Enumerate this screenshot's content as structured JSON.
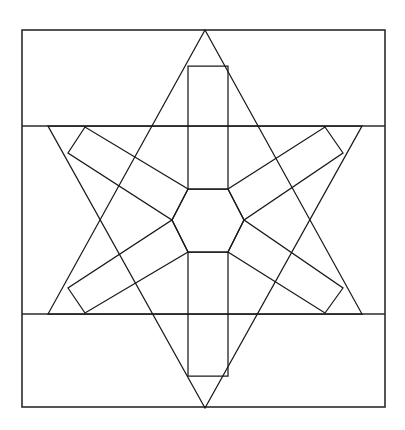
{
  "figure": {
    "title": "Hexagram star geometric line drawing",
    "background_color": "#ffffff",
    "line_color": "#1a1a1a",
    "frame_color": "#2b2b2b",
    "line_width": 1.25,
    "frame_line_width": 1.6,
    "canvas": {
      "width": 405,
      "height": 430
    },
    "frame": {
      "name": "outer-rectangle",
      "x": 22,
      "y": 30,
      "width": 363,
      "height": 377,
      "left": 22,
      "top": 30,
      "right": 385,
      "bottom": 407
    },
    "band_lines": [
      {
        "name": "upper-horizontal-line",
        "y": 126,
        "x1": 22,
        "x2": 385
      },
      {
        "name": "lower-horizontal-line",
        "y": 314,
        "x1": 22,
        "x2": 385
      }
    ],
    "hexagram": {
      "center_x": 205,
      "center_y": 220,
      "circumradius": 190,
      "upward_triangle": {
        "name": "upward-triangle",
        "points": "205,30 362,314 48,314"
      },
      "downward_triangle": {
        "name": "downward-triangle",
        "points": "205,408 48,126 362,126"
      }
    },
    "center_hexagon": {
      "name": "center-hexagon",
      "center_x": 208,
      "center_y": 220,
      "radius": 36,
      "points": "188,189 228,189 244,220 228,252 188,252 172,220"
    },
    "arms": [
      {
        "name": "arm-north",
        "angle_deg": 90,
        "points": "188,66 228,66 228,189 188,189"
      },
      {
        "name": "arm-south",
        "angle_deg": 270,
        "points": "188,252 228,252 228,376 188,376"
      },
      {
        "name": "arm-northwest",
        "angle_deg": 150,
        "points": "85,127 68,153 172,220 188,189"
      },
      {
        "name": "arm-northeast",
        "angle_deg": 30,
        "points": "325,127 343,153 244,220 228,189"
      },
      {
        "name": "arm-southwest",
        "angle_deg": 210,
        "points": "68,288 85,313 188,252 172,220"
      },
      {
        "name": "arm-southeast",
        "angle_deg": 330,
        "points": "343,288 325,313 228,252 244,220"
      }
    ]
  },
  "chart_data": {
    "type": "diagram",
    "title": "Hexagram star geometric line drawing",
    "shape_counts": {
      "outer_rectangles": 1,
      "horizontal_lines": 2,
      "triangles": 2,
      "hexagons": 1,
      "arm_quadrilaterals": 6
    }
  }
}
